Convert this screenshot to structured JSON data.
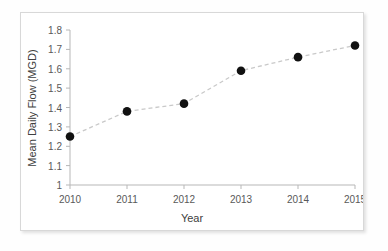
{
  "chart_data": {
    "type": "line",
    "title": "",
    "xlabel": "Year",
    "ylabel": "Mean Daily Flow (MGD)",
    "categories": [
      "2010",
      "2011",
      "2012",
      "2013",
      "2014",
      "2015"
    ],
    "x": [
      2010,
      2011,
      2012,
      2013,
      2014,
      2015
    ],
    "values": [
      1.25,
      1.38,
      1.42,
      1.59,
      1.66,
      1.72
    ],
    "series": [
      {
        "name": "Mean Daily Flow",
        "values": [
          1.25,
          1.38,
          1.42,
          1.59,
          1.66,
          1.72
        ],
        "line_style": "dashed",
        "line_color": "#c9c9c9",
        "marker": "circle",
        "marker_color": "#111111"
      }
    ],
    "xlim": [
      2010,
      2015
    ],
    "ylim": [
      1,
      1.8
    ],
    "ytick_labels": [
      "1.8",
      "1.7",
      "1.6",
      "1.5",
      "1.4",
      "1.3",
      "1.2",
      "1.1",
      "1"
    ],
    "ytick_values": [
      1.8,
      1.7,
      1.6,
      1.5,
      1.4,
      1.3,
      1.2,
      1.1,
      1.0
    ],
    "xtick_labels": [
      "2010",
      "2011",
      "2012",
      "2013",
      "2014",
      "2015"
    ],
    "grid": false,
    "legend": false,
    "legend_position": "none",
    "axis_color": "#b7b7b7",
    "tick_label_color": "#595959",
    "axis_title_color": "#404040",
    "background_color": "#ffffff"
  },
  "axes": {
    "y": {
      "title": "Mean Daily Flow (MGD)",
      "labels": {
        "t0": "1.8",
        "t1": "1.7",
        "t2": "1.6",
        "t3": "1.5",
        "t4": "1.4",
        "t5": "1.3",
        "t6": "1.2",
        "t7": "1.1",
        "t8": "1"
      }
    },
    "x": {
      "title": "Year",
      "labels": {
        "t0": "2010",
        "t1": "2011",
        "t2": "2012",
        "t3": "2013",
        "t4": "2014",
        "t5": "2015"
      }
    }
  }
}
